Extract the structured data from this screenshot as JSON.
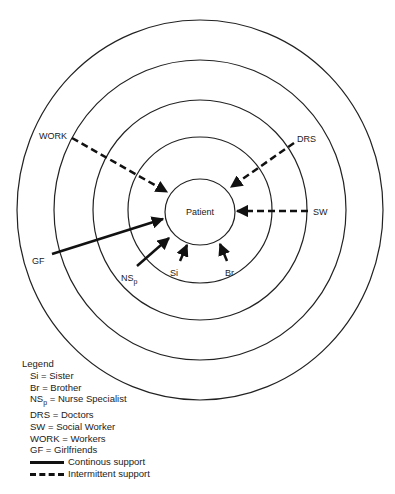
{
  "diagram": {
    "center_label": "Patient",
    "rings": [
      {
        "rx": 183,
        "ry": 190
      },
      {
        "rx": 146,
        "ry": 150
      },
      {
        "rx": 107,
        "ry": 110
      },
      {
        "rx": 72,
        "ry": 73
      },
      {
        "rx": 35,
        "ry": 33
      }
    ],
    "nodes": [
      {
        "id": "WORK",
        "label": "WORK",
        "support": "intermittent"
      },
      {
        "id": "DRS",
        "label": "DRS",
        "support": "intermittent"
      },
      {
        "id": "SW",
        "label": "SW",
        "support": "intermittent"
      },
      {
        "id": "GF",
        "label": "GF",
        "support": "continuous"
      },
      {
        "id": "NSp",
        "label": "NS",
        "label_sub": "p",
        "support": "continuous"
      },
      {
        "id": "Si",
        "label": "Si",
        "support": "continuous"
      },
      {
        "id": "Br",
        "label": "Br",
        "support": "continuous"
      }
    ]
  },
  "legend": {
    "title": "Legend",
    "items": [
      {
        "abbr": "Si",
        "text": " = Sister"
      },
      {
        "abbr": "Br",
        "text": " = Brother"
      },
      {
        "abbr": "NS",
        "abbr_sub": "p",
        "text": " = Nurse Specialist"
      },
      {
        "abbr": "DRS",
        "text": " = Doctors"
      },
      {
        "abbr": "SW",
        "text": " = Social Worker"
      },
      {
        "abbr": "WORK",
        "text": " = Workers"
      },
      {
        "abbr": "GF",
        "text": " = Girlfriends"
      }
    ],
    "line_types": [
      {
        "style": "solid",
        "label": "Continous support"
      },
      {
        "style": "dashed",
        "label": "Intermittent support"
      }
    ]
  }
}
